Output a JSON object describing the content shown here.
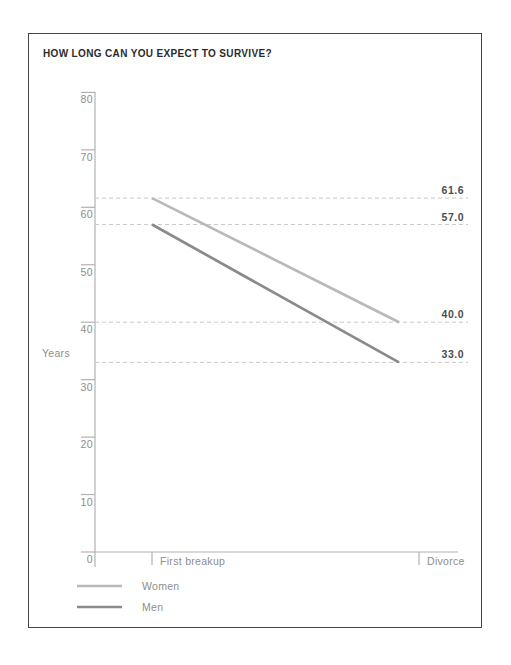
{
  "chart_data": {
    "type": "line",
    "title": "HOW LONG CAN YOU EXPECT TO SURVIVE?",
    "ylabel": "Years",
    "categories": [
      "First breakup",
      "Divorce"
    ],
    "series": [
      {
        "name": "Women",
        "values": [
          61.6,
          40.0
        ],
        "color": "#b9b9b9"
      },
      {
        "name": "Men",
        "values": [
          57.0,
          33.0
        ],
        "color": "#8a8a8a"
      }
    ],
    "annotations": [
      {
        "value": 61.6,
        "label": "61.6"
      },
      {
        "value": 57.0,
        "label": "57.0"
      },
      {
        "value": 40.0,
        "label": "40.0"
      },
      {
        "value": 33.0,
        "label": "33.0"
      }
    ],
    "y_ticks": [
      0,
      10,
      20,
      30,
      40,
      50,
      60,
      70,
      80
    ],
    "ylim": [
      0,
      80
    ],
    "grid": "dashed horizontal lines at annotation values",
    "legend_position": "bottom-left",
    "colors": {
      "axis": "#b2b2b2",
      "tick_label": "#8d8d8d",
      "dashed_line": "#c9c9c9",
      "annotation_label": "#4d4d4d",
      "title": "#2b2b2b",
      "border": "#454545"
    }
  }
}
